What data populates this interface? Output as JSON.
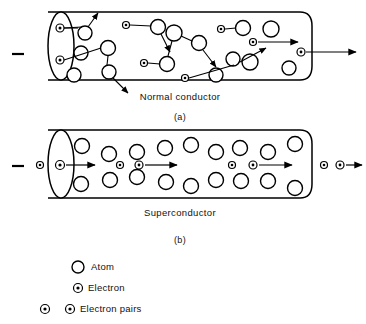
{
  "figure": {
    "panels": [
      {
        "id": "panel-a",
        "caption": "Normal conductor",
        "sub_caption": "(a)",
        "terminal_symbol": "−",
        "description": "Electrons scatter along zig-zag paths between atoms in a normal conductor"
      },
      {
        "id": "panel-b",
        "caption": "Superconductor",
        "sub_caption": "(b)",
        "terminal_symbol": "−",
        "description": "Electron pairs travel in straight lines through the lattice of atoms"
      }
    ],
    "legend": {
      "items": [
        {
          "key": "atom",
          "symbol": "atom-circle",
          "label": "Atom"
        },
        {
          "key": "electron",
          "symbol": "electron-circle",
          "label": "Electron"
        },
        {
          "key": "electron-pairs",
          "symbol": "electron-pair-circles",
          "label": "Electron pairs"
        }
      ]
    },
    "colors": {
      "ink": "#000000",
      "paper": "#ffffff"
    },
    "geometry": {
      "panel_a": {
        "tube": {
          "x_left": 48,
          "x_right": 312,
          "y_top": 12,
          "y_bottom": 80,
          "cap_rx": 13,
          "cap_ry": 34
        },
        "atoms": [
          {
            "cx": 85,
            "cy": 33,
            "r": 7
          },
          {
            "cx": 81,
            "cy": 53,
            "r": 7
          },
          {
            "cx": 74,
            "cy": 75,
            "r": 7
          },
          {
            "cx": 108,
            "cy": 48,
            "r": 7.5
          },
          {
            "cx": 109,
            "cy": 72,
            "r": 7
          },
          {
            "cx": 158,
            "cy": 27,
            "r": 7.5
          },
          {
            "cx": 174,
            "cy": 33,
            "r": 8
          },
          {
            "cx": 167,
            "cy": 64,
            "r": 7.5
          },
          {
            "cx": 199,
            "cy": 43,
            "r": 7.5
          },
          {
            "cx": 216,
            "cy": 75,
            "r": 7
          },
          {
            "cx": 243,
            "cy": 28,
            "r": 7.5
          },
          {
            "cx": 271,
            "cy": 29,
            "r": 8
          },
          {
            "cx": 250,
            "cy": 62,
            "r": 8
          },
          {
            "cx": 233,
            "cy": 59,
            "r": 7
          },
          {
            "cx": 289,
            "cy": 68,
            "r": 7
          },
          {
            "cx": 270,
            "cy": 57,
            "r": 7.5
          }
        ],
        "electrons": [
          {
            "cx": 60,
            "cy": 28,
            "r": 4
          },
          {
            "cx": 60,
            "cy": 60,
            "r": 4
          },
          {
            "cx": 126,
            "cy": 25,
            "r": 3.5
          },
          {
            "cx": 144,
            "cy": 63,
            "r": 3.5
          },
          {
            "cx": 221,
            "cy": 29,
            "r": 3.5
          },
          {
            "cx": 253,
            "cy": 42,
            "r": 3.5
          },
          {
            "cx": 185,
            "cy": 78,
            "r": 3.5
          },
          {
            "cx": 301,
            "cy": 52,
            "r": 4
          }
        ]
      },
      "panel_b": {
        "tube": {
          "x_left": 48,
          "x_right": 312,
          "y_top": 130,
          "y_bottom": 198,
          "cap_rx": 13,
          "cap_ry": 34
        },
        "atoms": [
          {
            "cx": 82,
            "cy": 146,
            "r": 7.5
          },
          {
            "cx": 81,
            "cy": 184,
            "r": 7.5
          },
          {
            "cx": 109,
            "cy": 154,
            "r": 7.5
          },
          {
            "cx": 110,
            "cy": 180,
            "r": 7.5
          },
          {
            "cx": 137,
            "cy": 152,
            "r": 7.5
          },
          {
            "cx": 137,
            "cy": 177,
            "r": 7.5
          },
          {
            "cx": 165,
            "cy": 148,
            "r": 7.5
          },
          {
            "cx": 166,
            "cy": 182,
            "r": 7.5
          },
          {
            "cx": 191,
            "cy": 145,
            "r": 7.5
          },
          {
            "cx": 191,
            "cy": 186,
            "r": 7.5
          },
          {
            "cx": 216,
            "cy": 152,
            "r": 7.5
          },
          {
            "cx": 216,
            "cy": 180,
            "r": 7.5
          },
          {
            "cx": 240,
            "cy": 148,
            "r": 7.5
          },
          {
            "cx": 241,
            "cy": 181,
            "r": 7.5
          },
          {
            "cx": 268,
            "cy": 152,
            "r": 7.5
          },
          {
            "cx": 268,
            "cy": 181,
            "r": 7.5
          },
          {
            "cx": 295,
            "cy": 144,
            "r": 7.5
          },
          {
            "cx": 295,
            "cy": 188,
            "r": 7.5
          }
        ],
        "electron_pairs": [
          {
            "cx": 40,
            "cy": 165,
            "r": 3.5
          },
          {
            "cx": 60,
            "cy": 165,
            "r": 4.5
          },
          {
            "cx": 120,
            "cy": 165,
            "r": 3.5
          },
          {
            "cx": 139,
            "cy": 165,
            "r": 4
          },
          {
            "cx": 232,
            "cy": 165,
            "r": 3.5
          },
          {
            "cx": 253,
            "cy": 165,
            "r": 4
          },
          {
            "cx": 324,
            "cy": 165,
            "r": 3.5
          },
          {
            "cx": 340,
            "cy": 165,
            "r": 4
          }
        ]
      }
    }
  }
}
